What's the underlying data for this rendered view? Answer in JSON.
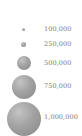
{
  "legend": {
    "type": "proportional-symbol",
    "items": [
      {
        "label": "100,000",
        "value": 100000
      },
      {
        "label": "250,000",
        "value": 250000
      },
      {
        "label": "500,000",
        "value": 500000
      },
      {
        "label": "750,000",
        "value": 750000
      },
      {
        "label": "1,000,000",
        "value": 1000000
      }
    ],
    "symbol_color": "#999999",
    "label_color": "#7a7a7a"
  }
}
